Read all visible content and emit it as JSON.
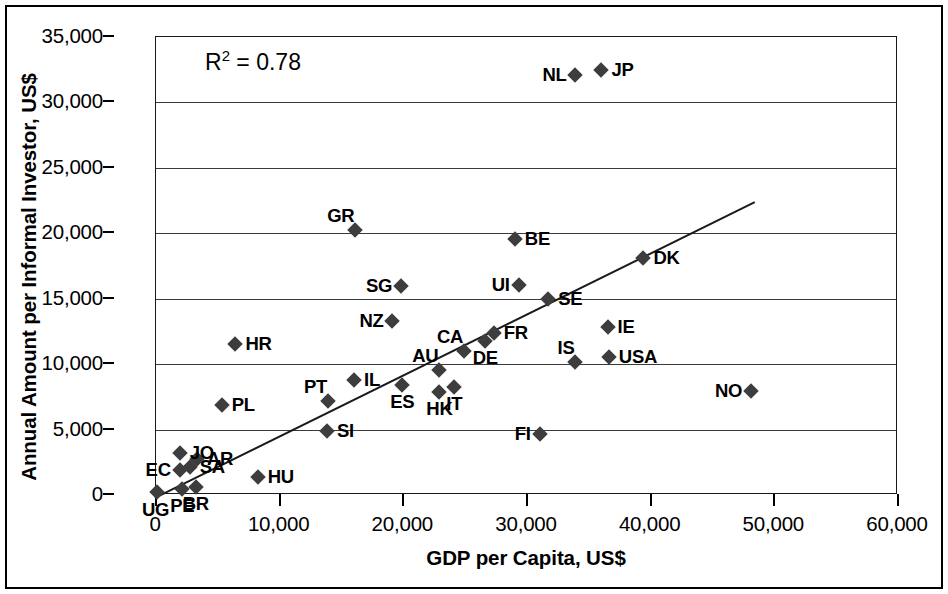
{
  "chart_data": {
    "type": "scatter",
    "title": "",
    "xlabel": "GDP per Capita, US$",
    "ylabel": "Annual Amount per Informal Investor, US$",
    "xlim": [
      0,
      60000
    ],
    "ylim": [
      0,
      35000
    ],
    "xticks": [
      "0",
      "10,000",
      "20,000",
      "30,000",
      "40,000",
      "50,000",
      "60,000"
    ],
    "xtick_values": [
      0,
      10000,
      20000,
      30000,
      40000,
      50000,
      60000
    ],
    "yticks": [
      "0",
      "5,000",
      "10,000",
      "15,000",
      "20,000",
      "25,000",
      "30,000",
      "35,000"
    ],
    "ytick_values": [
      0,
      5000,
      10000,
      15000,
      20000,
      25000,
      30000,
      35000
    ],
    "grid": "horizontal",
    "legend": "none",
    "annotation": "R2 = 0.78",
    "r_squared": "0.78",
    "trendline": {
      "x0": 0,
      "y0": -300,
      "x1": 48500,
      "y1": 22300
    },
    "points": [
      {
        "label": "UG",
        "x": 200,
        "y": 150,
        "lpos": "below-left"
      },
      {
        "label": "PE",
        "x": 2200,
        "y": 400,
        "lpos": "below"
      },
      {
        "label": "BR",
        "x": 3300,
        "y": 500,
        "lpos": "below"
      },
      {
        "label": "EC",
        "x": 2000,
        "y": 1800,
        "lpos": "left"
      },
      {
        "label": "SA",
        "x": 2800,
        "y": 2100,
        "lpos": "right"
      },
      {
        "label": "AR",
        "x": 3400,
        "y": 2700,
        "lpos": "right"
      },
      {
        "label": "JO",
        "x": 2000,
        "y": 3100,
        "lpos": "right"
      },
      {
        "label": "HU",
        "x": 8300,
        "y": 1300,
        "lpos": "right"
      },
      {
        "label": "HR",
        "x": 6500,
        "y": 11500,
        "lpos": "right"
      },
      {
        "label": "PL",
        "x": 5400,
        "y": 6800,
        "lpos": "right"
      },
      {
        "label": "SI",
        "x": 13900,
        "y": 4800,
        "lpos": "right"
      },
      {
        "label": "PT",
        "x": 14000,
        "y": 7100,
        "lpos": "above-left"
      },
      {
        "label": "IL",
        "x": 16100,
        "y": 8700,
        "lpos": "right"
      },
      {
        "label": "GR",
        "x": 16200,
        "y": 20200,
        "lpos": "above-left"
      },
      {
        "label": "SG",
        "x": 19900,
        "y": 15900,
        "lpos": "left"
      },
      {
        "label": "NZ",
        "x": 19200,
        "y": 13200,
        "lpos": "left"
      },
      {
        "label": "ES",
        "x": 20000,
        "y": 8300,
        "lpos": "below"
      },
      {
        "label": "HK",
        "x": 23000,
        "y": 7800,
        "lpos": "below"
      },
      {
        "label": "IT",
        "x": 24200,
        "y": 8200,
        "lpos": "below"
      },
      {
        "label": "AU",
        "x": 23000,
        "y": 9500,
        "lpos": "above-left"
      },
      {
        "label": "CA",
        "x": 25000,
        "y": 10900,
        "lpos": "above-left"
      },
      {
        "label": "DE",
        "x": 26700,
        "y": 11700,
        "lpos": "below"
      },
      {
        "label": "FR",
        "x": 27400,
        "y": 12300,
        "lpos": "right"
      },
      {
        "label": "UI",
        "x": 29400,
        "y": 16000,
        "lpos": "left"
      },
      {
        "label": "BE",
        "x": 29100,
        "y": 19500,
        "lpos": "right"
      },
      {
        "label": "FI",
        "x": 31100,
        "y": 4600,
        "lpos": "left"
      },
      {
        "label": "IS",
        "x": 34000,
        "y": 10100,
        "lpos": "above-left"
      },
      {
        "label": "USA",
        "x": 36700,
        "y": 10500,
        "lpos": "right"
      },
      {
        "label": "SE",
        "x": 31800,
        "y": 14900,
        "lpos": "right"
      },
      {
        "label": "IE",
        "x": 36600,
        "y": 12800,
        "lpos": "right"
      },
      {
        "label": "DK",
        "x": 39500,
        "y": 18000,
        "lpos": "right"
      },
      {
        "label": "NL",
        "x": 34000,
        "y": 32000,
        "lpos": "left"
      },
      {
        "label": "JP",
        "x": 36100,
        "y": 32400,
        "lpos": "right"
      },
      {
        "label": "NO",
        "x": 48200,
        "y": 7900,
        "lpos": "left"
      }
    ]
  }
}
